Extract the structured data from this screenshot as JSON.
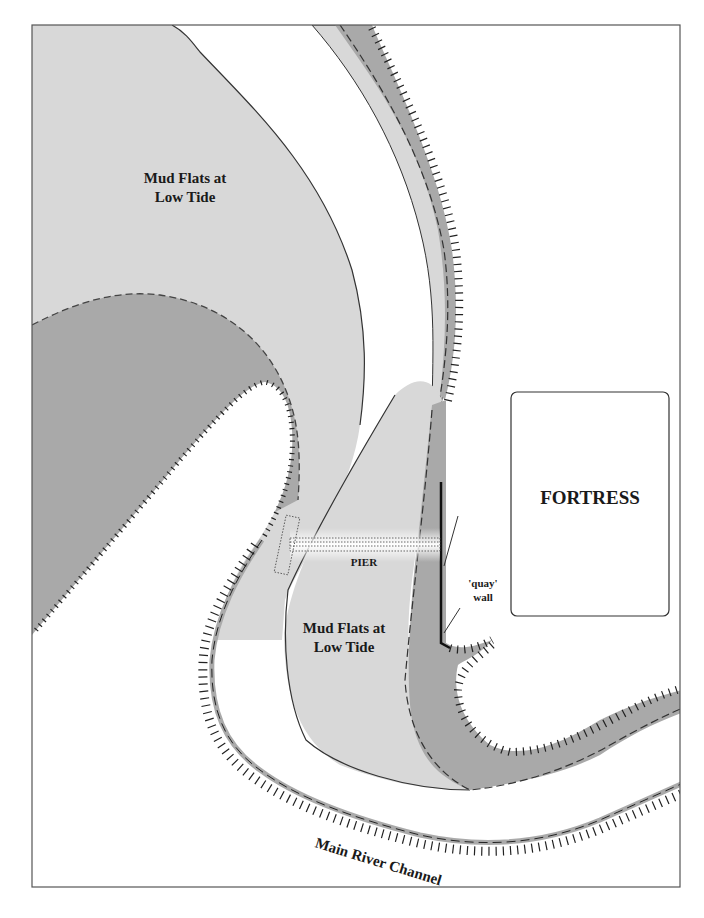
{
  "map": {
    "labels": {
      "mud_flats_north_line1": "Mud Flats at",
      "mud_flats_north_line2": "Low Tide",
      "mud_flats_south_line1": "Mud Flats at",
      "mud_flats_south_line2": "Low Tide",
      "fortress": "FORTRESS",
      "pier": "PIER",
      "quay_line1": "'quay'",
      "quay_line2": "wall",
      "channel": "Main River Channel"
    },
    "colors": {
      "background": "#ffffff",
      "mud_flat_light": "#d8d8d8",
      "mud_flat_dark": "#a9a9a9",
      "outline": "#333333",
      "frame": "#555555"
    }
  }
}
